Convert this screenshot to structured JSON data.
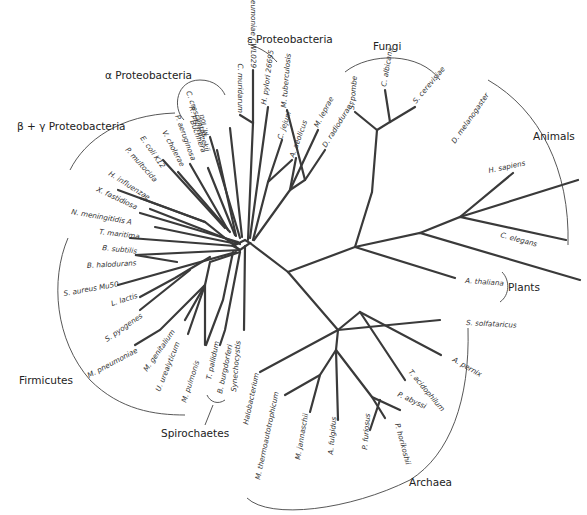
{
  "groups": {
    "alpha": "α Proteobacteria",
    "epsilon": "ε Proteobacteria",
    "betagamma": "β + γ Proteobacteria",
    "fungi": "Fungi",
    "animals": "Animals",
    "plants": "Plants",
    "firmicutes": "Firmicutes",
    "spirochaetes": "Spirochaetes",
    "archaea": "Archaea"
  },
  "leaves": {
    "c_pneumoniae": "C. pneumoniae CWL029",
    "c_muridarum": "C. muridarum",
    "h_pylori": "H. pylori 26695",
    "c_jejuni": "C. jejuni",
    "a_aeolicus": "A. aeolicus",
    "m_tuberculosis": "M. tuberculosis",
    "m_leprae": "M. leprae",
    "d_radiodurans": "D. radiodurans",
    "m_loti": "M. loti",
    "c_crescentus": "C. crescentus",
    "r_prowazekii": "R. prowazekii",
    "p_aeruginosa": "P. aeruginosa",
    "buchnera": "Buchnera",
    "v_cholerae": "V. cholerae",
    "e_coli": "E. coli K12",
    "p_multocida": "P. multocida",
    "h_influenzae": "H. influenzae",
    "x_fastidiosa": "X. fastidiosa",
    "n_meningitidis": "N. meningitidis A",
    "t_maritima": "T. maritima",
    "b_subtilis": "B. subtilis",
    "b_halodurans": "B. halodurans",
    "s_aureus": "S. aureus Mu50",
    "l_lactis": "L. lactis",
    "s_pyogenes": "S. pyogenes",
    "m_pneumoniae": "M. pneumoniae",
    "m_genitalium": "M. genitalium",
    "u_urealyticum": "U. urealyticum",
    "m_pulmonis": "M. pulmonis",
    "t_pallidum": "T. pallidum",
    "b_burgdorferi": "B. burgdorferi",
    "synechocystis": "Synechocystis",
    "halobacterium": "Halobacterium",
    "m_thermo": "M. thermoautotrophicum",
    "m_jannaschii": "M. jannaschii",
    "a_fulgidus": "A. fulgidus",
    "p_furiosus": "P. furiosus",
    "p_horikoshii": "P. horikoshii",
    "p_abyssi": "P. abyssi",
    "t_acidophilum": "T. acidophilum",
    "a_pernix": "A. pernix",
    "s_solfataricus": "S. solfataricus",
    "a_thaliana": "A. thaliana",
    "c_elegans": "C. elegans",
    "h_sapiens": "H. sapiens",
    "d_melanogaster": "D. melanogaster",
    "s_cerevisiae": "S. cerevisiae",
    "c_albicans": "C. albicans",
    "s_pombe": "S. pombe"
  }
}
